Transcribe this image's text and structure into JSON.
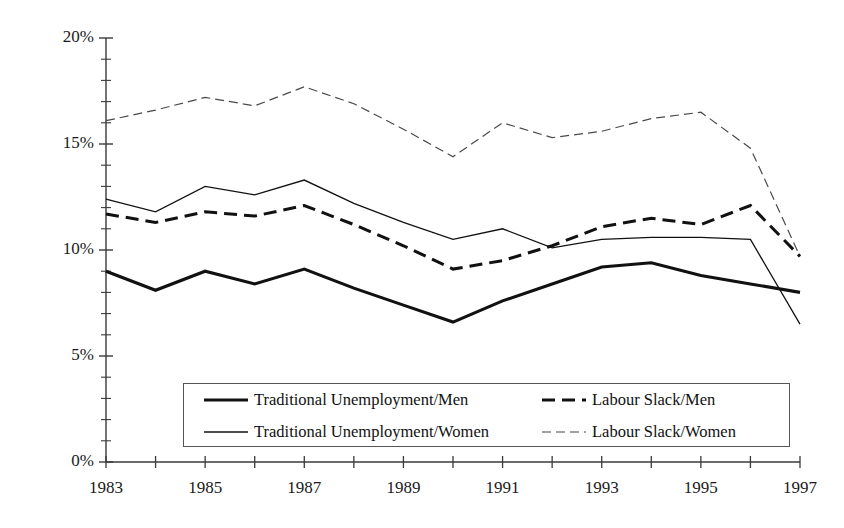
{
  "chart_data": {
    "type": "line",
    "title": "",
    "xlabel": "",
    "ylabel": "",
    "xlim": [
      1983,
      1997
    ],
    "ylim": [
      0,
      20
    ],
    "grid": false,
    "legend_position": "inside-bottom-center",
    "x": [
      1983,
      1984,
      1985,
      1986,
      1987,
      1988,
      1989,
      1990,
      1991,
      1992,
      1993,
      1994,
      1995,
      1996,
      1997
    ],
    "y_tick_labels": [
      "0%",
      "5%",
      "10%",
      "15%",
      "20%"
    ],
    "y_tick_values": [
      0,
      5,
      10,
      15,
      20
    ],
    "y_minor_tick_step": 1,
    "x_tick_values": [
      1983,
      1984,
      1985,
      1986,
      1987,
      1988,
      1989,
      1990,
      1991,
      1992,
      1993,
      1994,
      1995,
      1996,
      1997
    ],
    "x_tick_labels": [
      "1983",
      "",
      "1985",
      "",
      "1987",
      "",
      "1989",
      "",
      "1991",
      "",
      "1993",
      "",
      "1995",
      "",
      "1997"
    ],
    "series": [
      {
        "name": "Traditional Unemployment/Men",
        "style": "thick-solid",
        "color": "#111111",
        "values": [
          9.0,
          8.1,
          9.0,
          8.4,
          9.1,
          8.2,
          7.4,
          6.6,
          7.6,
          8.4,
          9.2,
          9.4,
          8.8,
          8.4,
          8.0
        ]
      },
      {
        "name": "Traditional Unemployment/Women",
        "style": "thin-solid",
        "color": "#111111",
        "values": [
          12.4,
          11.8,
          13.0,
          12.6,
          13.3,
          12.2,
          11.3,
          10.5,
          11.0,
          10.1,
          10.5,
          10.6,
          10.6,
          10.5,
          6.5
        ]
      },
      {
        "name": "Labour Slack/Men",
        "style": "thick-dashed",
        "color": "#111111",
        "values": [
          11.7,
          11.3,
          11.8,
          11.6,
          12.1,
          11.2,
          10.2,
          9.1,
          9.5,
          10.2,
          11.1,
          11.5,
          11.2,
          12.1,
          9.7
        ]
      },
      {
        "name": "Labour Slack/Women",
        "style": "thin-fine-dashed",
        "color": "#4a4a4a",
        "values": [
          16.1,
          16.6,
          17.2,
          16.8,
          17.7,
          16.9,
          15.7,
          14.4,
          16.0,
          15.3,
          15.6,
          16.2,
          16.5,
          14.8,
          9.7
        ]
      }
    ]
  },
  "legend": {
    "entries": [
      {
        "label": "Traditional Unemployment/Men",
        "style": "thick-solid"
      },
      {
        "label": "Labour Slack/Men",
        "style": "thick-dashed"
      },
      {
        "label": "Traditional Unemployment/Women",
        "style": "thin-solid"
      },
      {
        "label": "Labour Slack/Women",
        "style": "thin-fine-dashed"
      }
    ]
  }
}
